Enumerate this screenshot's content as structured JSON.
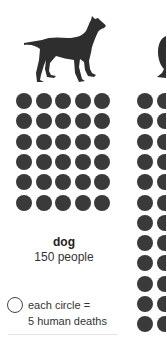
{
  "chart_data": {
    "type": "pictogram",
    "title": "",
    "unit": "each circle = 5 human deaths",
    "categories": [
      "dog"
    ],
    "series": [
      {
        "name": "dog",
        "label": "150 people",
        "value": 150,
        "circles": 30,
        "columns": 5,
        "rows": 6
      }
    ],
    "partial_next_column": {
      "icon": "human-head-icon",
      "visible_rows": 12
    }
  },
  "panels": [
    {
      "name": "dog",
      "value_label": "150 people",
      "icon": "dog-icon"
    }
  ],
  "legend": {
    "line1": "each circle =",
    "line2": "5 human deaths",
    "icon": "circle-outline-icon"
  },
  "colors": {
    "dot": "#3a3a3a",
    "text": "#333333",
    "background": "#ffffff"
  }
}
